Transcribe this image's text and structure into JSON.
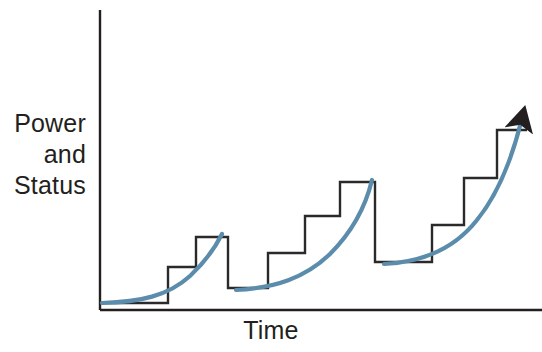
{
  "figure": {
    "background_color": "#ffffff"
  },
  "axes": {
    "y_label_lines": [
      "Power",
      "and",
      "Status"
    ],
    "x_label": "Time",
    "label_color": "#231f20",
    "axis_color": "#231f20",
    "y_axis_x": 100,
    "y_axis_top": 10,
    "y_axis_bottom": 310,
    "x_axis_y": 310,
    "x_axis_left": 100,
    "x_axis_right": 542
  },
  "style": {
    "step_color": "#2a2a2a",
    "step_width": 2.4,
    "curve_color": "#5b8cab",
    "curve_width": 4.2,
    "arrow_color": "#231f20"
  },
  "chart_data": {
    "type": "line",
    "xlabel": "Time",
    "ylabel": "Power and Status",
    "grid": false,
    "legend": null,
    "xlim": [
      100,
      542
    ],
    "ylim": [
      310,
      10
    ],
    "series": [
      {
        "name": "step-staircase",
        "kind": "step",
        "comment": "Polyline of the black staircase in pixel coords (x,y); y grows downward.",
        "points": [
          [
            100,
            303
          ],
          [
            168,
            303
          ],
          [
            168,
            267
          ],
          [
            196,
            267
          ],
          [
            196,
            237
          ],
          [
            228,
            237
          ],
          [
            228,
            288
          ],
          [
            268,
            288
          ],
          [
            268,
            253
          ],
          [
            305,
            253
          ],
          [
            305,
            216
          ],
          [
            340,
            216
          ],
          [
            340,
            182
          ],
          [
            375,
            182
          ],
          [
            375,
            262
          ],
          [
            432,
            262
          ],
          [
            432,
            225
          ],
          [
            464,
            225
          ],
          [
            464,
            178
          ],
          [
            497,
            178
          ],
          [
            497,
            130
          ],
          [
            527,
            130
          ]
        ]
      },
      {
        "name": "exponential-curve-cycle-1",
        "kind": "curve",
        "comment": "Smooth blue exponential sweeping up across cycle 1.",
        "path": "M 102 303 C 140 302, 168 296, 190 276 C 205 262, 215 248, 222 234"
      },
      {
        "name": "exponential-curve-cycle-2",
        "kind": "curve",
        "comment": "Smooth blue exponential sweeping up across cycle 2.",
        "path": "M 236 290 C 275 288, 305 278, 330 254 C 352 232, 366 205, 372 180"
      },
      {
        "name": "exponential-curve-cycle-3",
        "kind": "curve",
        "comment": "Smooth blue exponential sweeping up across cycle 3, ending in the arrowhead.",
        "path": "M 384 264 C 425 262, 455 248, 477 220 C 498 194, 512 158, 521 122"
      }
    ],
    "cycles": [
      {
        "index": 1,
        "floor_y": 303,
        "step_levels_y": [
          303,
          267,
          237
        ],
        "peak_y": 237,
        "drop_to_y": 288,
        "step_count": 3
      },
      {
        "index": 2,
        "floor_y": 288,
        "step_levels_y": [
          288,
          253,
          216,
          182
        ],
        "peak_y": 182,
        "drop_to_y": 262,
        "step_count": 4
      },
      {
        "index": 3,
        "floor_y": 262,
        "step_levels_y": [
          262,
          225,
          178,
          130
        ],
        "peak_y": 130,
        "drop_to_y": null,
        "step_count": 4
      }
    ],
    "annotations": [
      {
        "name": "growth-arrowhead",
        "type": "arrowhead",
        "x": 523,
        "y": 118,
        "angle_deg": -62,
        "color": "#231f20"
      }
    ]
  }
}
